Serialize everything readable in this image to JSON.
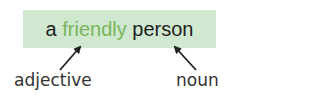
{
  "phrase": {
    "article": "a ",
    "adjective_word": "friendly",
    "space": " ",
    "noun_word": "person"
  },
  "labels": {
    "adjective": "adjective",
    "noun": "noun"
  },
  "colors": {
    "box_background": "#cfe8cf",
    "adjective_text": "#7ab55c",
    "text": "#1e1e1e",
    "arrow": "#222222"
  }
}
